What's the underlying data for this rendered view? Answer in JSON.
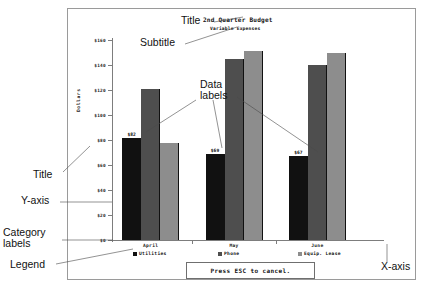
{
  "chart_data": {
    "type": "bar",
    "title": "2nd Quarter Budget",
    "subtitle": "Variable Expenses",
    "xlabel": "",
    "ylabel": "Dollars",
    "categories": [
      "April",
      "May",
      "June"
    ],
    "series": [
      {
        "name": "Utilities",
        "values": [
          82,
          69,
          67
        ],
        "color": "#111111"
      },
      {
        "name": "Phone",
        "values": [
          121,
          145,
          140
        ],
        "color": "#4e4e4e"
      },
      {
        "name": "Equip. Lease",
        "values": [
          78,
          151,
          150
        ],
        "color": "#8d8d8d"
      }
    ],
    "ylim": [
      0,
      160
    ],
    "yticks": [
      0,
      20,
      40,
      60,
      80,
      100,
      120,
      140,
      160
    ],
    "ytick_labels": [
      "$0",
      "$20",
      "$40",
      "$60",
      "$80",
      "$100",
      "$120",
      "$140",
      "$160"
    ],
    "grid": false,
    "legend_position": "bottom",
    "data_labels": [
      {
        "series": "Utilities",
        "category": "April",
        "text": "$82"
      },
      {
        "series": "Utilities",
        "category": "May",
        "text": "$69"
      },
      {
        "series": "Utilities",
        "category": "June",
        "text": "$67"
      }
    ]
  },
  "status": {
    "message": "Press ESC to cancel."
  },
  "annotations": [
    {
      "id": "title",
      "label": "Title",
      "x": 181,
      "y": 22
    },
    {
      "id": "subtitle",
      "label": "Subtitle",
      "x": 140,
      "y": 44
    },
    {
      "id": "data-labels",
      "label_line1": "Data",
      "label_line2": "labels",
      "x": 200,
      "y": 86
    },
    {
      "id": "y-axis-title",
      "label": "Title",
      "x": 33,
      "y": 176
    },
    {
      "id": "y-axis",
      "label": "Y-axis",
      "x": 21,
      "y": 202
    },
    {
      "id": "category-labels",
      "label_line1": "Category",
      "label_line2": "labels",
      "x": 3,
      "y": 234
    },
    {
      "id": "legend",
      "label": "Legend",
      "x": 10,
      "y": 266
    },
    {
      "id": "x-axis",
      "label": "X-axis",
      "x": 381,
      "y": 268
    }
  ]
}
